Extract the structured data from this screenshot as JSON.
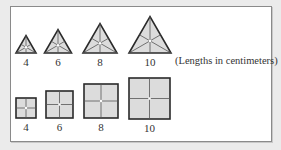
{
  "triangles": [
    {
      "label": "4",
      "cx": 26,
      "side": 20,
      "base_y": 53
    },
    {
      "label": "6",
      "cx": 58,
      "side": 27,
      "base_y": 53
    },
    {
      "label": "8",
      "cx": 100,
      "side": 34,
      "base_y": 53
    },
    {
      "label": "10",
      "cx": 150,
      "side": 42,
      "base_y": 53
    }
  ],
  "squares": [
    {
      "label": "4",
      "x": 16,
      "y": 98,
      "size": 20
    },
    {
      "label": "6",
      "x": 46,
      "y": 91,
      "size": 27
    },
    {
      "label": "8",
      "x": 84,
      "y": 84,
      "size": 34
    },
    {
      "label": "10",
      "x": 129,
      "y": 78,
      "size": 41
    }
  ],
  "note": "(Lengths in centimeters)",
  "colors": {
    "fill": "#dcdcdc",
    "stroke": "#2a2a2a",
    "inner": "#555555"
  }
}
